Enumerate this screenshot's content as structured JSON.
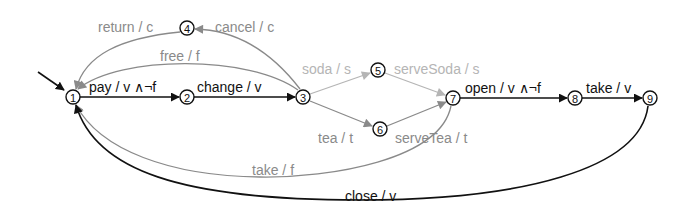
{
  "diagram": {
    "type": "state-machine",
    "colors": {
      "dark": "#111111",
      "gray": "#8a8a8a",
      "light": "#b5b5b5",
      "background": "#ffffff"
    },
    "initial_state": "1",
    "states": [
      {
        "id": "1",
        "label": "1"
      },
      {
        "id": "2",
        "label": "2"
      },
      {
        "id": "3",
        "label": "3"
      },
      {
        "id": "4",
        "label": "4"
      },
      {
        "id": "5",
        "label": "5"
      },
      {
        "id": "6",
        "label": "6"
      },
      {
        "id": "7",
        "label": "7"
      },
      {
        "id": "8",
        "label": "8"
      },
      {
        "id": "9",
        "label": "9"
      }
    ],
    "transitions": [
      {
        "from": "1",
        "to": "2",
        "label": "pay / v ∧¬f",
        "style": "dark"
      },
      {
        "from": "2",
        "to": "3",
        "label": "change / v",
        "style": "dark"
      },
      {
        "from": "3",
        "to": "1",
        "label": "free / f",
        "style": "gray"
      },
      {
        "from": "3",
        "to": "4",
        "label": "cancel / c",
        "style": "gray"
      },
      {
        "from": "4",
        "to": "1",
        "label": "return / c",
        "style": "gray"
      },
      {
        "from": "3",
        "to": "5",
        "label": "soda / s",
        "style": "light"
      },
      {
        "from": "5",
        "to": "7",
        "label": "serveSoda / s",
        "style": "light"
      },
      {
        "from": "3",
        "to": "6",
        "label": "tea / t",
        "style": "gray"
      },
      {
        "from": "6",
        "to": "7",
        "label": "serveTea / t",
        "style": "gray"
      },
      {
        "from": "7",
        "to": "8",
        "label": "open / v ∧¬f",
        "style": "dark"
      },
      {
        "from": "8",
        "to": "9",
        "label": "take / v",
        "style": "dark"
      },
      {
        "from": "7",
        "to": "1",
        "label": "take / f",
        "style": "gray"
      },
      {
        "from": "9",
        "to": "1",
        "label": "close / v",
        "style": "dark"
      }
    ]
  }
}
